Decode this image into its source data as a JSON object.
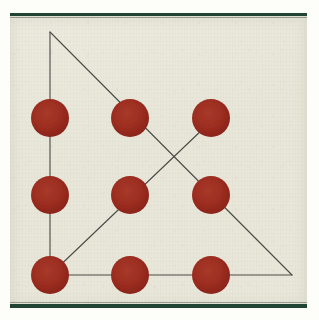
{
  "figure": {
    "caption": "",
    "medium": "scanned printed page"
  },
  "colors": {
    "paper": "#e8e7da",
    "dot_fill": "#9e2f22",
    "dot_fill_dark": "#8c2418",
    "line": "#4a4a46",
    "bar_green": "#1f4434",
    "scan_margin": "#fdfdfa"
  },
  "canvas": {
    "width": 319,
    "height": 320,
    "paper_left": 10,
    "paper_top": 16,
    "paper_width": 297,
    "paper_height": 290
  },
  "bars": [
    {
      "name": "top-bar",
      "y": 13,
      "height": 3
    },
    {
      "name": "bottom-bar",
      "y": 304,
      "height": 4
    }
  ],
  "grid": {
    "rows": 3,
    "cols": 3,
    "col_x": [
      50,
      130,
      211
    ],
    "row_y": [
      118,
      195,
      275
    ],
    "dot_radius": 19,
    "count": 9
  },
  "dots": [
    {
      "id": "dot-r1c1",
      "row": 1,
      "col": 1,
      "cx": 50,
      "cy": 118,
      "r": 19
    },
    {
      "id": "dot-r1c2",
      "row": 1,
      "col": 2,
      "cx": 130,
      "cy": 118,
      "r": 19
    },
    {
      "id": "dot-r1c3",
      "row": 1,
      "col": 3,
      "cx": 211,
      "cy": 118,
      "r": 19
    },
    {
      "id": "dot-r2c1",
      "row": 2,
      "col": 1,
      "cx": 50,
      "cy": 195,
      "r": 19
    },
    {
      "id": "dot-r2c2",
      "row": 2,
      "col": 2,
      "cx": 130,
      "cy": 195,
      "r": 19
    },
    {
      "id": "dot-r2c3",
      "row": 2,
      "col": 3,
      "cx": 211,
      "cy": 195,
      "r": 19
    },
    {
      "id": "dot-r3c1",
      "row": 3,
      "col": 1,
      "cx": 50,
      "cy": 275,
      "r": 19
    },
    {
      "id": "dot-r3c2",
      "row": 3,
      "col": 2,
      "cx": 130,
      "cy": 275,
      "r": 19
    },
    {
      "id": "dot-r3c3",
      "row": 3,
      "col": 3,
      "cx": 211,
      "cy": 275,
      "r": 19
    }
  ],
  "lines": [
    {
      "id": "line-left-vertical",
      "label": "left vertical side",
      "x1": 50,
      "y1": 32,
      "x2": 50,
      "y2": 275
    },
    {
      "id": "line-bottom-horizontal",
      "label": "bottom horizontal side",
      "x1": 50,
      "y1": 275,
      "x2": 292,
      "y2": 275
    },
    {
      "id": "line-main-diagonal",
      "label": "apex to lower-right hypotenuse",
      "x1": 50,
      "y1": 32,
      "x2": 292,
      "y2": 275
    },
    {
      "id": "line-cross-diagonal",
      "label": "bottom-left to top-right crossing diagonal",
      "x1": 50,
      "y1": 275,
      "x2": 204,
      "y2": 128
    }
  ],
  "vertices": [
    {
      "id": "vertex-apex",
      "label": "top apex",
      "x": 50,
      "y": 32
    },
    {
      "id": "vertex-bottom-left",
      "label": "bottom-left corner",
      "x": 50,
      "y": 275
    },
    {
      "id": "vertex-bottom-right",
      "label": "bottom-right corner",
      "x": 292,
      "y": 275
    },
    {
      "id": "vertex-crossing",
      "label": "diagonal intersection point",
      "x": 127,
      "y": 152
    }
  ]
}
